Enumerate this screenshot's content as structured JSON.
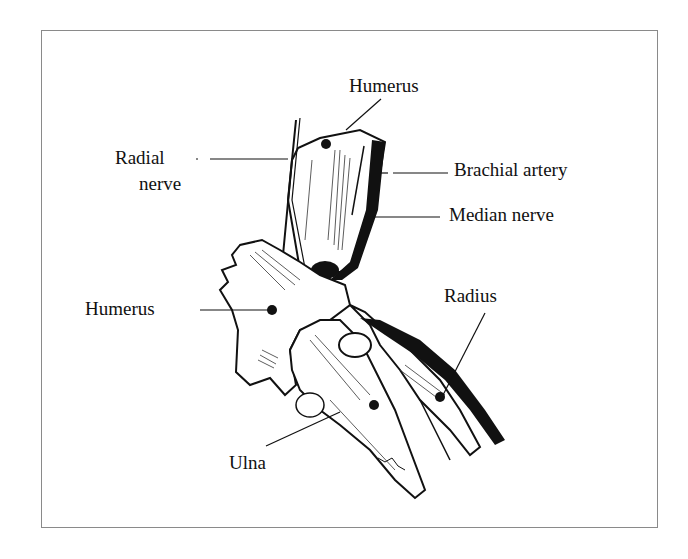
{
  "figure": {
    "type": "anatomical line drawing",
    "colors": {
      "ink": "#111111",
      "frame": "#8a8a8a",
      "background": "#ffffff"
    }
  },
  "labels": {
    "humerus_top": "Humerus",
    "radial_nerve_line1": "Radial",
    "radial_nerve_line2": "nerve",
    "brachial_artery": "Brachial artery",
    "median_nerve": "Median nerve",
    "humerus_left": "Humerus",
    "radius": "Radius",
    "ulna": "Ulna"
  }
}
